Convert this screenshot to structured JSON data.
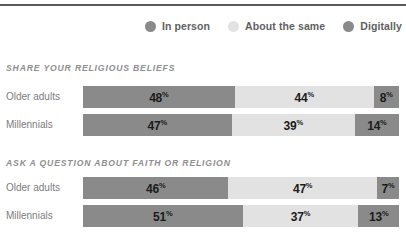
{
  "legend": {
    "items": [
      {
        "label": "In person",
        "color": "#8a8a8a",
        "icon": "legend-dot-icon"
      },
      {
        "label": "About the same",
        "color": "#e2e2e2",
        "icon": "legend-dot-icon"
      },
      {
        "label": "Digitally",
        "color": "#8a8a8a",
        "icon": "legend-dot-icon"
      }
    ]
  },
  "chart_data": {
    "type": "bar",
    "title": "",
    "orientation": "horizontal",
    "stacked": true,
    "units": "percent",
    "xlabel": "",
    "ylabel": "",
    "xlim": [
      0,
      100
    ],
    "grid": false,
    "legend_position": "top-right",
    "series": [
      {
        "name": "In person",
        "color": "#8a8a8a"
      },
      {
        "name": "About the same",
        "color": "#e2e2e2"
      },
      {
        "name": "Digitally",
        "color": "#8a8a8a"
      }
    ],
    "panels": [
      {
        "title": "SHARE YOUR RELIGIOUS BELIEFS",
        "categories": [
          "Older adults",
          "Millennials"
        ],
        "rows": [
          {
            "category": "Older adults",
            "segments": [
              {
                "series": "In person",
                "value": 48,
                "label": "48",
                "suffix": "%"
              },
              {
                "series": "About the same",
                "value": 44,
                "label": "44",
                "suffix": "%"
              },
              {
                "series": "Digitally",
                "value": 8,
                "label": "8",
                "suffix": "%"
              }
            ]
          },
          {
            "category": "Millennials",
            "segments": [
              {
                "series": "In person",
                "value": 47,
                "label": "47",
                "suffix": "%"
              },
              {
                "series": "About the same",
                "value": 39,
                "label": "39",
                "suffix": "%"
              },
              {
                "series": "Digitally",
                "value": 14,
                "label": "14",
                "suffix": "%"
              }
            ]
          }
        ]
      },
      {
        "title": "ASK A QUESTION ABOUT FAITH OR RELIGION",
        "categories": [
          "Older adults",
          "Millennials"
        ],
        "rows": [
          {
            "category": "Older adults",
            "segments": [
              {
                "series": "In person",
                "value": 46,
                "label": "46",
                "suffix": "%"
              },
              {
                "series": "About the same",
                "value": 47,
                "label": "47",
                "suffix": "%"
              },
              {
                "series": "Digitally",
                "value": 7,
                "label": "7",
                "suffix": "%"
              }
            ]
          },
          {
            "category": "Millennials",
            "segments": [
              {
                "series": "In person",
                "value": 51,
                "label": "51",
                "suffix": "%"
              },
              {
                "series": "About the same",
                "value": 37,
                "label": "37",
                "suffix": "%"
              },
              {
                "series": "Digitally",
                "value": 13,
                "label": "13",
                "suffix": "%"
              }
            ]
          }
        ]
      }
    ]
  }
}
